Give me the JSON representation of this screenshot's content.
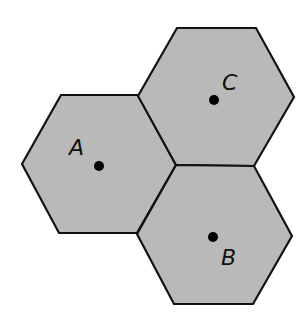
{
  "diagram": {
    "type": "hexagonal-cells",
    "background": "#ffffff",
    "fill_color": "#b9b9b9",
    "stroke_color": "#111111",
    "hexagons": [
      {
        "id": "A",
        "points": "22,164 61,95 138,95 176,165 137,233 59,233",
        "dot": {
          "cx": 99,
          "cy": 166,
          "r": 5
        },
        "label": {
          "text": "A",
          "x": 69,
          "y": 155
        }
      },
      {
        "id": "C",
        "points": "138,96 177,28 256,28 294,97 254,166 176,165",
        "dot": {
          "cx": 214,
          "cy": 100,
          "r": 5
        },
        "label": {
          "text": "C",
          "x": 222,
          "y": 90
        }
      },
      {
        "id": "B",
        "points": "137,234 176,165 254,166 292,236 253,304 174,304",
        "dot": {
          "cx": 213,
          "cy": 237,
          "r": 5
        },
        "label": {
          "text": "B",
          "x": 221,
          "y": 265
        }
      }
    ]
  }
}
